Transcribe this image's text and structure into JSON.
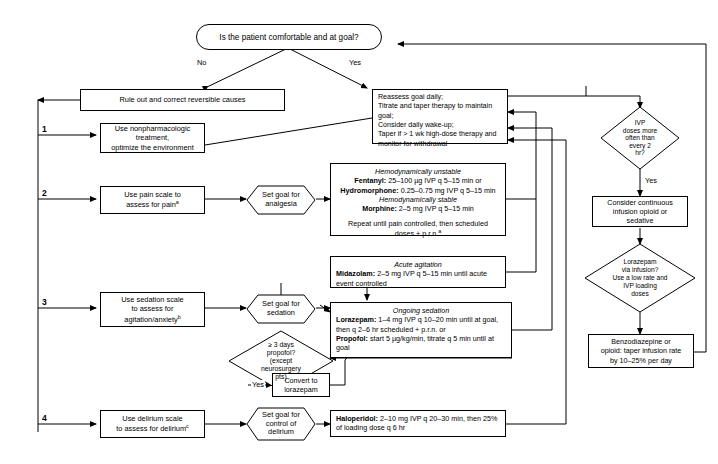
{
  "diagram": {
    "entry": {
      "question": "Is the patient comfortable and at goal?",
      "branch_no": "No",
      "branch_yes": "Yes"
    },
    "left_column": {
      "rule_out": "Rule out and correct reversible causes",
      "steps": [
        {
          "num": "1",
          "text": "Use nonpharmacologic treatment,\noptimize the environment"
        },
        {
          "num": "2",
          "text": "Use pain scale to\nassess for pain*"
        },
        {
          "num": "3",
          "text": "Use sedation scale\nto assess for\nagitation/anxiety"
        },
        {
          "num": "4",
          "text": "Use delirium scale\nto assess for delirium"
        }
      ]
    },
    "goals": [
      {
        "label": "Set goal for\nanalgesia"
      },
      {
        "label": "Set goal for\nsedation"
      },
      {
        "label": "Set goal for\ncontrol of\ndelirium"
      }
    ],
    "reassess_box": [
      "Reassess goal daily;",
      "Titrate and taper therapy to maintain goal;",
      "Consider daily wake-up;",
      "Taper if > 1 wk high-dose therapy and",
      "monitor for withdrawal"
    ],
    "analgesia_box": {
      "heading_unstable": "Hemodynamically unstable",
      "lines_unstable": [
        {
          "drug": "Fentanyl:",
          "dose": " 25–100 µg IVP q 5–15 min or"
        },
        {
          "drug": "Hydromorphone:",
          "dose": " 0.25–0.75 mg IVP q 5–15 min"
        }
      ],
      "heading_stable": "Hemodynamically stable",
      "lines_stable": [
        {
          "drug": "Morphine:",
          "dose": " 2–5 mg IVP q 5–15 min"
        }
      ],
      "footer": "Repeat until pain controlled, then scheduled\ndoses + p.r.n."
    },
    "acute_agitation_box": {
      "heading": "Acute agitation",
      "drug": "Midazolam:",
      "dose": " 2–5 mg IVP q 5–15 min until acute event controlled"
    },
    "ongoing_sedation_box": {
      "heading": "Ongoing sedation",
      "line1_drug": "Lorazepam:",
      "line1_dose": " 1–4 mg IVP q 10–20 min until at goal, then q 2–6 hr scheduled + p.r.n. or",
      "line2_drug": "Propofol:",
      "line2_dose": " start 5 µg/kg/min, titrate q 5 min until at goal"
    },
    "delirium_box": {
      "drug": "Haloperidol:",
      "dose": " 2–10 mg IVP q 20–30 min, then 25% of loading dose q 6 hr"
    },
    "propofol_decision": {
      "text": "≥ 3 days\npropofol?\n(except\nneurosurgery\npts)",
      "yes_label": "Yes",
      "yes_target": "Convert to\nlorazepam"
    },
    "right_column": {
      "ivp_decision": "IVP\ndoses more\noften than\nevery 2\nhr?",
      "ivp_yes": "Yes",
      "continuous_infusion": "Consider continuous\ninfusion opioid or\nsedative",
      "lorazepam_decision": "Lorazepam\nvia infusion?\nUse a low rate and\nIVP loading\ndoses",
      "taper_box": "Benzodiazepine or\nopioid: taper infusion rate\nby 10–25% per day"
    },
    "footnotes": {
      "pain_marker": "a",
      "prn_marker": "a",
      "sedation_marker": "b",
      "delirium_marker": "c"
    },
    "colors": {
      "stroke": "#000000",
      "background": "#ffffff"
    }
  }
}
